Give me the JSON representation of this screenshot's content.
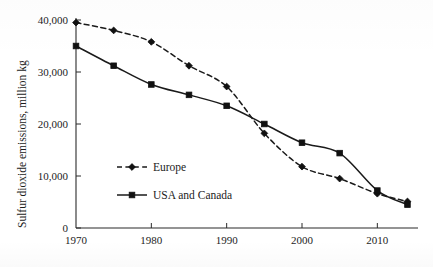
{
  "chart_data": {
    "type": "line",
    "title": "",
    "xlabel": "",
    "ylabel": "Sulfur dioxide emissions, million kg",
    "xlim": [
      1970,
      2015
    ],
    "ylim": [
      0,
      41000
    ],
    "grid": false,
    "legend_position": "inside-left-lower",
    "x_ticks": [
      1970,
      1980,
      1990,
      2000,
      2010
    ],
    "x_tick_labels": [
      "1970",
      "1980",
      "1990",
      "2000",
      "2010"
    ],
    "x_minor_ticks": [
      1975,
      1985,
      1995,
      2005
    ],
    "y_ticks": [
      0,
      10000,
      20000,
      30000,
      40000
    ],
    "y_tick_labels": [
      "0",
      "10,000",
      "20,000",
      "30,000",
      "40,000"
    ],
    "x": [
      1970,
      1975,
      1980,
      1985,
      1990,
      1995,
      2000,
      2005,
      2010,
      2014
    ],
    "series": [
      {
        "name": "Europe",
        "style": "dashed",
        "marker": "diamond",
        "color": "#1a1a1a",
        "values": [
          39500,
          38000,
          35800,
          31200,
          27200,
          18200,
          11800,
          9500,
          6600,
          5100
        ]
      },
      {
        "name": "USA and Canada",
        "style": "solid",
        "marker": "square",
        "color": "#1a1a1a",
        "values": [
          35000,
          31200,
          27600,
          25600,
          23500,
          20000,
          16400,
          14400,
          7200,
          4500
        ]
      }
    ]
  },
  "legend": {
    "entries": [
      {
        "label": "Europe"
      },
      {
        "label": "USA and Canada"
      }
    ]
  },
  "axes": {
    "y_axis_title": "Sulfur dioxide emissions, million kg"
  },
  "icons": {
    "diamond_marker": "diamond-marker-icon",
    "square_marker": "square-marker-icon"
  }
}
